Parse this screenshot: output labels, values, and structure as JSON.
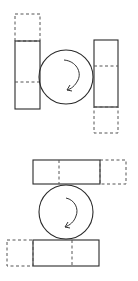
{
  "diagram": {
    "colors": {
      "stroke": "#2a2a2a",
      "dashed": "#555555",
      "background": "#ffffff"
    },
    "panels": [
      {
        "name": "vertical-plates",
        "roller": {
          "cx": 66,
          "cy": 77,
          "r": 27,
          "rotation": "clockwise"
        },
        "left_plate": {
          "x": 15,
          "y": 41,
          "w": 25,
          "h": 68,
          "midline_y": 82,
          "displaced": {
            "x": 15,
            "y": 14,
            "w": 25,
            "h": 27,
            "direction": "up"
          }
        },
        "right_plate": {
          "x": 94,
          "y": 40,
          "w": 24,
          "h": 67,
          "midline_y": 66,
          "displaced": {
            "x": 94,
            "y": 107,
            "w": 24,
            "h": 26,
            "direction": "down"
          }
        }
      },
      {
        "name": "horizontal-plates",
        "roller": {
          "cx": 66,
          "cy": 212,
          "r": 27,
          "rotation": "clockwise"
        },
        "top_plate": {
          "x": 33,
          "y": 160,
          "w": 67,
          "h": 24,
          "midline_x": 59,
          "displaced": {
            "x": 100,
            "y": 160,
            "w": 26,
            "h": 24,
            "direction": "right"
          }
        },
        "bottom_plate": {
          "x": 33,
          "y": 240,
          "w": 66,
          "h": 26,
          "midline_x": 72,
          "displaced": {
            "x": 7,
            "y": 240,
            "w": 26,
            "h": 26,
            "direction": "left"
          }
        }
      }
    ]
  }
}
